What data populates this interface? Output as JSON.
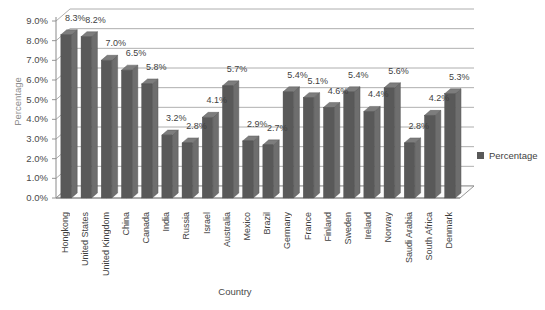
{
  "chart_data": {
    "type": "bar",
    "title": "",
    "subtitle": "",
    "xlabel": "Country",
    "ylabel": "Percentage",
    "ylim": [
      0,
      9
    ],
    "ytick_labels": [
      "9.0%",
      "8.0%",
      "7.0%",
      "6.0%",
      "5.0%",
      "4.0%",
      "3.0%",
      "2.0%",
      "1.0%",
      "0.0%"
    ],
    "ytick_values": [
      9,
      8,
      7,
      6,
      5,
      4,
      3,
      2,
      1,
      0
    ],
    "grid": true,
    "legend_position": "right",
    "legend": [
      "Percentage"
    ],
    "series_name": "Percentage",
    "series_color": "#595959",
    "categories": [
      "Hongkong",
      "United States",
      "United Kingdom",
      "China",
      "Canada",
      "India",
      "Russia",
      "Israel",
      "Australia",
      "Mexico",
      "Brazil",
      "Germany",
      "France",
      "Finland",
      "Sweden",
      "Ireland",
      "Norway",
      "Saudi Arabia",
      "South Africa",
      "Denmark"
    ],
    "values": [
      8.3,
      8.2,
      7.0,
      6.5,
      5.8,
      3.2,
      2.8,
      4.1,
      5.7,
      2.9,
      2.7,
      5.4,
      5.1,
      4.6,
      5.4,
      4.4,
      5.6,
      2.8,
      4.2,
      5.3
    ],
    "data_labels": [
      "8.3%",
      "8.2%",
      "7.0%",
      "6.5%",
      "5.8%",
      "3.2%",
      "2.8%",
      "4.1%",
      "5.7%",
      "2.9%",
      "2.7%",
      "5.4%",
      "5.1%",
      "4.6%",
      "5.4%",
      "4.4%",
      "5.6%",
      "2.8%",
      "4.2%",
      "5.3%"
    ]
  },
  "colors": {
    "bar": "#595959",
    "bar_side": "#6e6e6e",
    "bar_top": "#7d7d7d",
    "gridline": "#9a9a9a",
    "axis": "#8a8a8a",
    "floor": "#fbfbfb",
    "text": "#3f3f3f",
    "axis_title_muted": "#8d8d8d",
    "background": "#ffffff"
  }
}
